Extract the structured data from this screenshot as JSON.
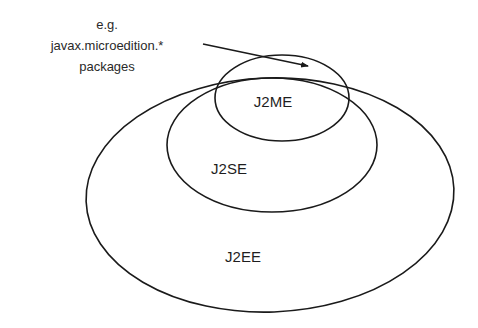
{
  "diagram": {
    "type": "nested-ellipses",
    "annotation": {
      "lines": [
        "e.g.",
        "javax.microedition.*",
        "packages"
      ]
    },
    "sets": [
      {
        "id": "j2ee",
        "label": "J2EE",
        "cx": 270,
        "cy": 195,
        "rx": 184,
        "ry": 117,
        "label_x": 243,
        "label_y": 255
      },
      {
        "id": "j2se",
        "label": "J2SE",
        "cx": 272,
        "cy": 145,
        "rx": 105,
        "ry": 67,
        "label_x": 230,
        "label_y": 168
      },
      {
        "id": "j2me",
        "label": "J2ME",
        "cx": 282,
        "cy": 98,
        "rx": 67,
        "ry": 43,
        "label_x": 273,
        "label_y": 101
      }
    ],
    "arrow": {
      "from": [
        203,
        44
      ],
      "to": [
        308,
        66
      ]
    },
    "stroke_color": "#1a1a1a"
  }
}
